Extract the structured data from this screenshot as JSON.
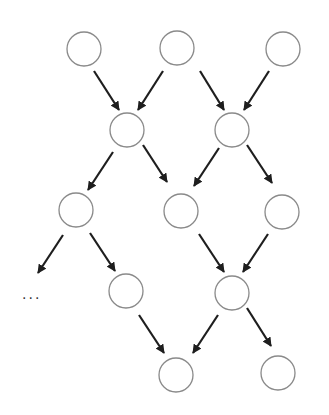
{
  "diagram": {
    "type": "directed-graph",
    "style": {
      "node_stroke": "#8a8a8a",
      "node_fill": "#ffffff",
      "edge_color": "#1e1e1e",
      "background": "#ffffff"
    },
    "node_radius": 17,
    "nodes": [
      {
        "id": "n1",
        "x": 84,
        "y": 49
      },
      {
        "id": "n2",
        "x": 177,
        "y": 48
      },
      {
        "id": "n3",
        "x": 283,
        "y": 49
      },
      {
        "id": "n4",
        "x": 127,
        "y": 130
      },
      {
        "id": "n5",
        "x": 232,
        "y": 130
      },
      {
        "id": "n6",
        "x": 76,
        "y": 210
      },
      {
        "id": "n7",
        "x": 181,
        "y": 211
      },
      {
        "id": "n8",
        "x": 282,
        "y": 212
      },
      {
        "id": "n9",
        "x": 126,
        "y": 291
      },
      {
        "id": "n10",
        "x": 232,
        "y": 293
      },
      {
        "id": "n11",
        "x": 176,
        "y": 375
      },
      {
        "id": "n12",
        "x": 278,
        "y": 373
      }
    ],
    "edges": [
      {
        "from": "n1",
        "to": "n4",
        "x1": 94,
        "y1": 71,
        "x2": 119,
        "y2": 110
      },
      {
        "from": "n2",
        "to": "n4",
        "x1": 163,
        "y1": 71,
        "x2": 138,
        "y2": 110
      },
      {
        "from": "n2",
        "to": "n5",
        "x1": 200,
        "y1": 71,
        "x2": 224,
        "y2": 110
      },
      {
        "from": "n3",
        "to": "n5",
        "x1": 269,
        "y1": 71,
        "x2": 244,
        "y2": 110
      },
      {
        "from": "n4",
        "to": "n6",
        "x1": 113,
        "y1": 152,
        "x2": 88,
        "y2": 190
      },
      {
        "from": "n4",
        "to": "n7",
        "x1": 143,
        "y1": 145,
        "x2": 167,
        "y2": 182
      },
      {
        "from": "n5",
        "to": "n7",
        "x1": 219,
        "y1": 148,
        "x2": 194,
        "y2": 186
      },
      {
        "from": "n5",
        "to": "n8",
        "x1": 247,
        "y1": 145,
        "x2": 272,
        "y2": 183
      },
      {
        "from": "n6",
        "to": "ellipsis",
        "x1": 63,
        "y1": 235,
        "x2": 38,
        "y2": 273
      },
      {
        "from": "n6",
        "to": "n9",
        "x1": 90,
        "y1": 233,
        "x2": 115,
        "y2": 271
      },
      {
        "from": "n7",
        "to": "n10",
        "x1": 199,
        "y1": 234,
        "x2": 224,
        "y2": 272
      },
      {
        "from": "n8",
        "to": "n10",
        "x1": 268,
        "y1": 234,
        "x2": 243,
        "y2": 272
      },
      {
        "from": "n9",
        "to": "n11",
        "x1": 139,
        "y1": 315,
        "x2": 164,
        "y2": 353
      },
      {
        "from": "n10",
        "to": "n11",
        "x1": 218,
        "y1": 315,
        "x2": 193,
        "y2": 353
      },
      {
        "from": "n10",
        "to": "n12",
        "x1": 247,
        "y1": 308,
        "x2": 271,
        "y2": 346
      }
    ],
    "ellipsis": {
      "text": "···",
      "x": 22,
      "y": 303
    }
  }
}
